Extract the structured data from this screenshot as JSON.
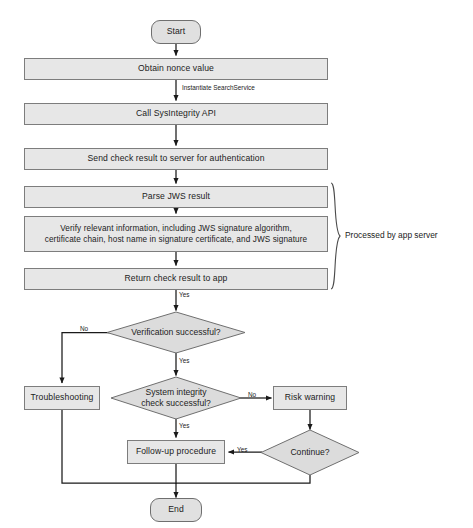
{
  "diagram": {
    "colors": {
      "process_fill": "#e7e7e7",
      "process_stroke": "#7d7d7d",
      "terminator_fill": "#e0e0e0",
      "terminator_stroke": "#6f6f6f",
      "decision_fill": "#dcdcdc",
      "decision_stroke": "#6f6f6f",
      "connector": "#1a1a1a",
      "background": "#ffffff"
    },
    "nodes": {
      "start": {
        "label": "Start",
        "type": "terminator"
      },
      "obtain_nonce": {
        "label": "Obtain nonce value",
        "type": "process"
      },
      "call_api": {
        "label": "Call SysIntegrity API",
        "type": "process"
      },
      "send_check_result": {
        "label": "Send check result to server for authentication",
        "type": "process"
      },
      "parse_jws": {
        "label": "Parse JWS result",
        "type": "process"
      },
      "verify_info_line1": {
        "label": "Verify relevant information, including JWS signature algorithm,",
        "type": "process"
      },
      "verify_info_line2": {
        "label": "certificate chain, host name in signature certificate, and JWS signature",
        "type": "process"
      },
      "return_result": {
        "label": "Return check result to app",
        "type": "process"
      },
      "verification_decision": {
        "label": "Verification successful?",
        "type": "decision"
      },
      "integrity_decision_line1": {
        "label": "System integrity",
        "type": "decision"
      },
      "integrity_decision_line2": {
        "label": "check successful?",
        "type": "decision"
      },
      "troubleshooting": {
        "label": "Troubleshooting",
        "type": "process"
      },
      "risk_warning": {
        "label": "Risk warning",
        "type": "process"
      },
      "continue_decision": {
        "label": "Continue?",
        "type": "decision"
      },
      "follow_up": {
        "label": "Follow-up procedure",
        "type": "process"
      },
      "end": {
        "label": "End",
        "type": "terminator"
      }
    },
    "edge_labels": {
      "instantiate": "Instantiate SearchService",
      "return_yes": "Yes",
      "verification_no": "No",
      "verification_yes": "Yes",
      "integrity_no": "No",
      "integrity_yes": "Yes",
      "continue_yes": "Yes"
    },
    "annotations": {
      "app_server_bracket": "Processed by app server"
    }
  }
}
